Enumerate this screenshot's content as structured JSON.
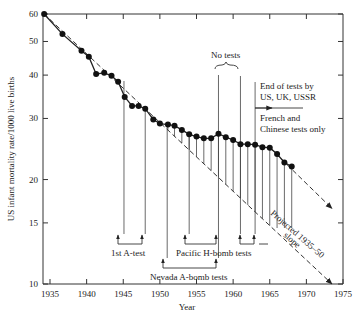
{
  "chart_data": {
    "type": "line",
    "title": "",
    "xlabel": "Year",
    "ylabel": "US infant mortality rate/1000 live births",
    "yscale": "log",
    "xlim": [
      1934.2,
      1975
    ],
    "ylim": [
      10,
      60
    ],
    "x_ticks": [
      1935,
      1940,
      1945,
      1950,
      1955,
      1960,
      1965,
      1970,
      1975
    ],
    "x_tick_labels": [
      "1935",
      "1940",
      "1945",
      "1950",
      "1955",
      "1960",
      "1965",
      "1970",
      "1975"
    ],
    "y_ticks": [
      10,
      15,
      20,
      30,
      40,
      50,
      60
    ],
    "y_tick_labels": [
      "10",
      "15",
      "20",
      "30",
      "40",
      "50",
      "60"
    ],
    "grid": false,
    "series": [
      {
        "name": "US infant mortality rate",
        "style": "solid line with filled circle markers",
        "x": [
          1934.2,
          1936.7,
          1939.3,
          1940.3,
          1941.3,
          1942.4,
          1943.4,
          1944.3,
          1945.2,
          1946.2,
          1947.1,
          1948.0,
          1949.1,
          1950.0,
          1951.1,
          1952.0,
          1953.0,
          1954.0,
          1955.0,
          1956.0,
          1957.0,
          1958.0,
          1959.0,
          1960.0,
          1961.0,
          1962.0,
          1963.0,
          1964.0,
          1965.0,
          1966.0,
          1967.0,
          1968.0
        ],
        "values": [
          60,
          52.5,
          47.0,
          45.2,
          40.3,
          40.6,
          39.8,
          38.3,
          34.6,
          32.6,
          32.6,
          32.0,
          29.8,
          29.0,
          28.8,
          28.6,
          27.8,
          27.0,
          26.6,
          26.3,
          26.3,
          27.1,
          26.5,
          26.0,
          25.3,
          25.3,
          25.2,
          24.8,
          24.7,
          23.7,
          22.4,
          21.8
        ]
      },
      {
        "name": "Projected 1935-50 slope",
        "style": "dashed line with arrowhead",
        "x": [
          1934.2,
          1973.5
        ],
        "values": [
          60,
          10
        ]
      },
      {
        "name": "Post-1965 trend projection",
        "style": "dashed line with arrowhead",
        "x": [
          1965.0,
          1973.5
        ],
        "values": [
          24.7,
          16.5
        ]
      }
    ],
    "annotations": [
      {
        "text": "No tests",
        "x_range": [
          1958,
          1961
        ]
      },
      {
        "text": "End of tests by US, UK, USSR",
        "x": 1963
      },
      {
        "text": "French and Chinese tests only",
        "x": 1963
      },
      {
        "text": "1st A-test",
        "x_range": [
          1945,
          1948
        ]
      },
      {
        "text": "Pacific H-bomb tests",
        "x_range": [
          1954,
          1958
        ]
      },
      {
        "text": "Pacific H-bomb tests",
        "x_range": [
          1961,
          1963
        ]
      },
      {
        "text": "Nevada A-bomb tests",
        "x_range": [
          1951,
          1958
        ]
      },
      {
        "text": "Projected 1935–50 slope",
        "rotated": true
      }
    ],
    "legend": "none"
  },
  "labels": {
    "xlabel": "Year",
    "ylabel": "US infant mortality rate/1000 live births",
    "no_tests": "No tests",
    "end_tests_line1": "End of tests by",
    "end_tests_line2": "US, UK, USSR",
    "french_line1": "French and",
    "french_line2": "Chinese tests only",
    "first_a_test": "1st A-test",
    "pacific": "Pacific H-bomb tests",
    "nevada": "Nevada A-bomb tests",
    "projected_line1": "Projected 1935–50",
    "projected_line2": "slope"
  }
}
